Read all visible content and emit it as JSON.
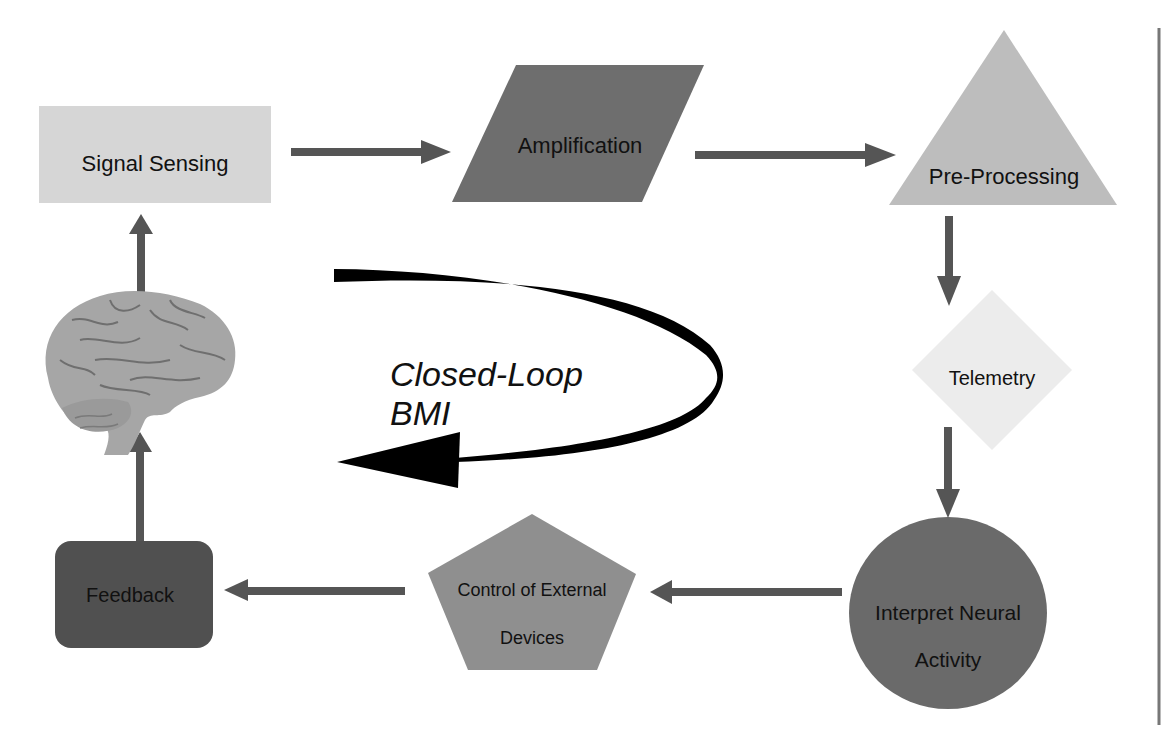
{
  "diagram": {
    "title_line1": "Closed-Loop",
    "title_line2": "BMI",
    "nodes": {
      "signal_sensing": {
        "label": "Signal Sensing",
        "shape": "rectangle",
        "fill": "#d6d6d6"
      },
      "amplification": {
        "label": "Amplification",
        "shape": "parallelogram",
        "fill": "#6e6e6e"
      },
      "pre_processing": {
        "label": "Pre-Processing",
        "shape": "triangle",
        "fill": "#bdbdbd"
      },
      "telemetry": {
        "label": "Telemetry",
        "shape": "diamond",
        "fill": "#ececec"
      },
      "interpret": {
        "label_line1": "Interpret Neural",
        "label_line2": "Activity",
        "shape": "circle",
        "fill": "#6a6a6a"
      },
      "control": {
        "label_line1": "Control of External",
        "label_line2": "Devices",
        "shape": "pentagon",
        "fill": "#8f8f8f"
      },
      "feedback": {
        "label": "Feedback",
        "shape": "rounded-rectangle",
        "fill": "#505050"
      },
      "brain": {
        "label": "brain-image",
        "shape": "image",
        "fill": "#a9a9a9"
      }
    },
    "edges": [
      {
        "from": "Signal Sensing",
        "to": "Amplification"
      },
      {
        "from": "Amplification",
        "to": "Pre-Processing"
      },
      {
        "from": "Pre-Processing",
        "to": "Telemetry"
      },
      {
        "from": "Telemetry",
        "to": "Interpret Neural Activity"
      },
      {
        "from": "Interpret Neural Activity",
        "to": "Control of External Devices"
      },
      {
        "from": "Control of External Devices",
        "to": "Feedback"
      },
      {
        "from": "Feedback",
        "to": "Brain"
      },
      {
        "from": "Brain",
        "to": "Signal Sensing"
      }
    ],
    "colors": {
      "arrow": "#555555",
      "loop_arrow": "#000000",
      "border_line": "#777777"
    }
  }
}
